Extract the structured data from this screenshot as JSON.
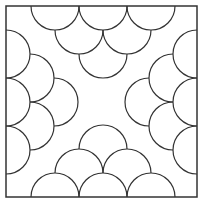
{
  "figure": {
    "stroke_color": "#333333",
    "background": "#ffffff",
    "square": {
      "x": 6,
      "y": 6,
      "size": 191
    },
    "radius": 24,
    "groups": [
      {
        "side": "top",
        "centers": [
          [
            55,
            6
          ],
          [
            103,
            6
          ],
          [
            151,
            6
          ],
          [
            79,
            30
          ],
          [
            127,
            30
          ],
          [
            103,
            54
          ]
        ]
      },
      {
        "side": "bottom",
        "centers": [
          [
            55,
            197
          ],
          [
            103,
            197
          ],
          [
            151,
            197
          ],
          [
            79,
            173
          ],
          [
            127,
            173
          ],
          [
            103,
            149
          ]
        ]
      },
      {
        "side": "left",
        "centers": [
          [
            6,
            54
          ],
          [
            6,
            102
          ],
          [
            6,
            150
          ],
          [
            30,
            78
          ],
          [
            30,
            126
          ],
          [
            54,
            102
          ]
        ]
      },
      {
        "side": "right",
        "centers": [
          [
            197,
            54
          ],
          [
            197,
            102
          ],
          [
            197,
            150
          ],
          [
            173,
            78
          ],
          [
            173,
            126
          ],
          [
            149,
            102
          ]
        ]
      }
    ]
  }
}
